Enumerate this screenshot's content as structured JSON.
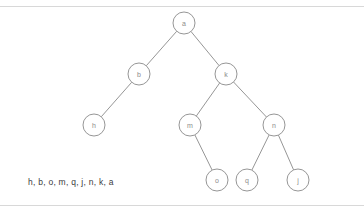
{
  "figure": {
    "caption": "h, b, o, m, q, j, n, k, a",
    "stroke_color": "#8a8a8a",
    "node_fill": "#ffffff",
    "label_color": "#8c8c8c",
    "caption_color": "#3b3b3b",
    "rule_color": "#d8d8d8",
    "background": "#ffffff"
  },
  "tree": {
    "node_radius": 11,
    "nodes": [
      {
        "id": "a",
        "label": "a",
        "x": 184,
        "y": 23
      },
      {
        "id": "b",
        "label": "b",
        "x": 139,
        "y": 74
      },
      {
        "id": "k",
        "label": "k",
        "x": 226,
        "y": 74
      },
      {
        "id": "h",
        "label": "h",
        "x": 94,
        "y": 125
      },
      {
        "id": "m",
        "label": "m",
        "x": 190,
        "y": 125
      },
      {
        "id": "n",
        "label": "n",
        "x": 274,
        "y": 125
      },
      {
        "id": "o",
        "label": "o",
        "x": 217,
        "y": 180
      },
      {
        "id": "q",
        "label": "q",
        "x": 247,
        "y": 180
      },
      {
        "id": "j",
        "label": "j",
        "x": 298,
        "y": 180
      }
    ],
    "edges": [
      {
        "from": "a",
        "to": "b"
      },
      {
        "from": "a",
        "to": "k"
      },
      {
        "from": "b",
        "to": "h"
      },
      {
        "from": "k",
        "to": "m"
      },
      {
        "from": "k",
        "to": "n"
      },
      {
        "from": "m",
        "to": "o"
      },
      {
        "from": "n",
        "to": "q"
      },
      {
        "from": "n",
        "to": "j"
      }
    ]
  }
}
